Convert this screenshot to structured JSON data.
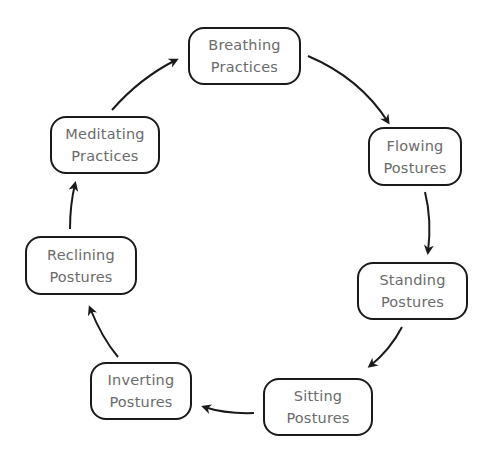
{
  "diagram": {
    "type": "cycle",
    "colors": {
      "box_border": "#1a1a1a",
      "text": "#6b6b6b",
      "arrow": "#1a1a1a",
      "background": "#ffffff"
    },
    "nodes": [
      {
        "id": "breathing",
        "line1": "Breathing",
        "line2": "Practices"
      },
      {
        "id": "flowing",
        "line1": "Flowing",
        "line2": "Postures"
      },
      {
        "id": "standing",
        "line1": "Standing",
        "line2": "Postures"
      },
      {
        "id": "sitting",
        "line1": "Sitting",
        "line2": "Postures"
      },
      {
        "id": "inverting",
        "line1": "Inverting",
        "line2": "Postures"
      },
      {
        "id": "reclining",
        "line1": "Reclining",
        "line2": "Postures"
      },
      {
        "id": "meditating",
        "line1": "Meditating",
        "line2": "Practices"
      }
    ],
    "edges": [
      {
        "from": "Breathing Practices",
        "to": "Flowing Postures"
      },
      {
        "from": "Flowing Postures",
        "to": "Standing Postures"
      },
      {
        "from": "Standing Postures",
        "to": "Sitting Postures"
      },
      {
        "from": "Sitting Postures",
        "to": "Inverting Postures"
      },
      {
        "from": "Inverting Postures",
        "to": "Reclining Postures"
      },
      {
        "from": "Reclining Postures",
        "to": "Meditating Practices"
      },
      {
        "from": "Meditating Practices",
        "to": "Breathing Practices"
      }
    ]
  }
}
